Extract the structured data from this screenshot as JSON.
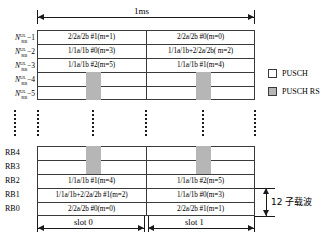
{
  "figure": {
    "title_top": "1ms",
    "subcarrier_note": "12 子载波"
  },
  "legend": {
    "items": [
      {
        "label": "PUSCH",
        "swatch": "white",
        "color": "#ffffff"
      },
      {
        "label": "PUSCH RS",
        "swatch": "gray",
        "color": "#b6b6b6"
      }
    ]
  },
  "slots": {
    "left_label": "slot 0",
    "right_label": "slot 1"
  },
  "top_rows": [
    {
      "axis_prefix": "N",
      "axis_sup": "UL",
      "axis_sub": "RB",
      "axis_suffix": "−1",
      "slot0": "2/2a/2b  #1(m=1)",
      "slot1": "2/2a/2b  #0(m=0)"
    },
    {
      "axis_prefix": "N",
      "axis_sup": "UL",
      "axis_sub": "RB",
      "axis_suffix": "−2",
      "slot0": "1/1a/1b  #0(m=3)",
      "slot1": "1/1a/1b+2/2a/2b( m=2)"
    },
    {
      "axis_prefix": "N",
      "axis_sup": "UL",
      "axis_sub": "RB",
      "axis_suffix": "−3",
      "slot0": "1/1a/1b  #2(m=5)",
      "slot1": "1/1a/1b  #1(m=4)"
    },
    {
      "axis_prefix": "N",
      "axis_sup": "UL",
      "axis_sub": "RB",
      "axis_suffix": "−4",
      "slot0": "",
      "slot1": ""
    },
    {
      "axis_prefix": "N",
      "axis_sup": "UL",
      "axis_sub": "RB",
      "axis_suffix": "−5",
      "slot0": "",
      "slot1": ""
    }
  ],
  "bottom_rows": [
    {
      "axis_label": "RB4",
      "slot0": "",
      "slot1": ""
    },
    {
      "axis_label": "RB3",
      "slot0": "",
      "slot1": ""
    },
    {
      "axis_label": "RB2",
      "slot0": "1/1a/1b  #1(m=4)",
      "slot1": "1/1a/1b  #2(m=5)"
    },
    {
      "axis_label": "RB1",
      "slot0": "1/1a/1b+2/2a/2b  #1(m=2)",
      "slot1": "1/1a/1b  #0(m=3)"
    },
    {
      "axis_label": "RB0",
      "slot0": "2/2a/2b  #0(m=0)",
      "slot1": "2/2a/2b  #1(m=1)"
    }
  ],
  "colors": {
    "rs_fill": "#b6b6b6",
    "line": "#3a3a3a",
    "text": "#000000",
    "background": "#ffffff"
  }
}
